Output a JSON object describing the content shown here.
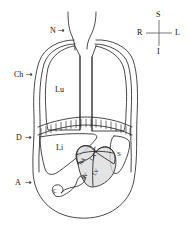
{
  "figure": {
    "background_color": "#ffffff",
    "stroke_color": "#1a1a1a",
    "heart_fill_color": "#d9d9d9",
    "width": 190,
    "height": 241
  },
  "compass": {
    "name": "orientation-compass",
    "superior": "S",
    "inferior": "I",
    "right": "R",
    "left": "L"
  },
  "callouts": [
    {
      "key": "neck",
      "label": "N",
      "arrow": "→"
    },
    {
      "key": "chest-wall",
      "label": "Ch",
      "arrow": "→"
    },
    {
      "key": "diaphragm",
      "label": "D",
      "arrow": "→"
    },
    {
      "key": "abdomen",
      "label": "A",
      "arrow": "→"
    }
  ],
  "organs": {
    "lung": "Lu",
    "liver": "Li",
    "spleen": "S",
    "stomach": "C"
  },
  "heart_chambers": {
    "right_atrium": "RA",
    "left_atrium": "LA",
    "right_ventricle": "RV",
    "left_ventricle": "LV"
  }
}
